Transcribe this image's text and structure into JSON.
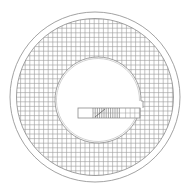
{
  "diagram": {
    "title": "",
    "background": "#ffffff",
    "line_color": "#8a8a8a",
    "grid_color": "#9a9a9a",
    "outer_circle": {
      "cx": 95,
      "cy": 97,
      "r": 85
    },
    "ring_circle": {
      "cx": 95,
      "cy": 97,
      "r": 78.5
    },
    "inner_circle": {
      "cx": 98,
      "cy": 100,
      "r": 43,
      "r2": 41.5
    },
    "grid": {
      "spacing": 4.6,
      "origin_x": 16,
      "origin_y": 19
    },
    "bar": {
      "x": 78,
      "y": 108,
      "width": 62,
      "height": 10,
      "dense_hatch_start": 93,
      "dense_hatch_end": 121,
      "sparse_hatch_end": 140
    },
    "notch": {
      "top_y": 101,
      "right_x": 143
    }
  }
}
